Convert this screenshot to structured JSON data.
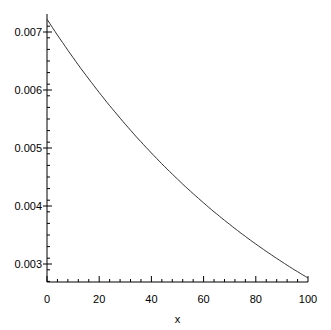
{
  "chart_data": {
    "type": "line",
    "title": "",
    "xlabel": "x",
    "ylabel": "",
    "xlim": [
      0,
      100
    ],
    "ylim": [
      0.00272,
      0.00725
    ],
    "x_ticks": [
      "0",
      "20",
      "40",
      "60",
      "80",
      "100"
    ],
    "y_ticks": [
      "0.003",
      "0.004",
      "0.005",
      "0.006",
      "0.007"
    ],
    "grid": false,
    "series": [
      {
        "name": "f(x)",
        "x": [
          0,
          10,
          20,
          30,
          40,
          50,
          60,
          70,
          80,
          90,
          100
        ],
        "values": [
          0.00722,
          0.00656,
          0.00596,
          0.00541,
          0.00492,
          0.00447,
          0.00406,
          0.00369,
          0.00335,
          0.00304,
          0.00276
        ]
      }
    ]
  }
}
